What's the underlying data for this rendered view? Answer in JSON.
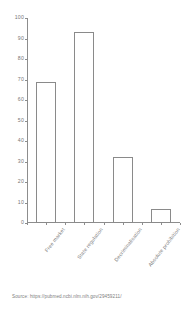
{
  "chart_data": {
    "type": "bar",
    "title": "",
    "xlabel": "",
    "ylabel": "",
    "ylim": [
      0,
      100
    ],
    "yticks": [
      0,
      10,
      20,
      30,
      40,
      50,
      60,
      70,
      80,
      90,
      100
    ],
    "grid": false,
    "legend": null,
    "categories": [
      "Free market",
      "State regulation",
      "Decriminalisation",
      "Absolute prohibition"
    ],
    "values": [
      69,
      93,
      32,
      7
    ]
  },
  "source": {
    "text": "Source: https://pubmed.ncbi.nlm.nih.gov/29459211/"
  },
  "style": {
    "axis_color": "#8d8d8d",
    "bar_edge_color": "#8a8a8a",
    "bar_fill_color": "#ffffff",
    "text_color": "#777777",
    "background": "#ffffff"
  }
}
